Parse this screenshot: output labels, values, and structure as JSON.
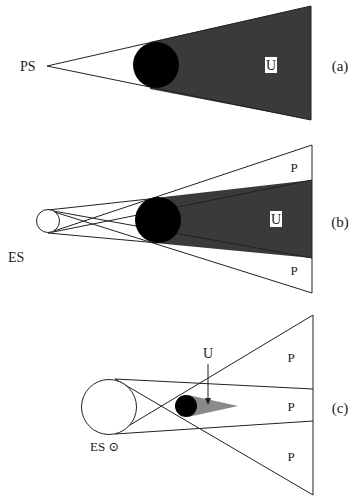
{
  "figure": {
    "panels": [
      {
        "id": "a",
        "panel_label": "(a)",
        "source_label": "PS",
        "umbra_label": "U",
        "source_type": "point source"
      },
      {
        "id": "b",
        "panel_label": "(b)",
        "source_label": "ES",
        "umbra_label": "U",
        "penumbra_labels": [
          "P",
          "P"
        ],
        "source_type": "extended source smaller than object"
      },
      {
        "id": "c",
        "panel_label": "(c)",
        "source_label": "ES ⊙",
        "umbra_label": "U",
        "penumbra_labels": [
          "P",
          "P",
          "P"
        ],
        "source_type": "extended source larger than object"
      }
    ],
    "colors": {
      "background": "#ffffff",
      "object": "#000000",
      "umbra_dark": "#3a3a3a",
      "umbra_light": "#8a8a8a",
      "lines": "#222222"
    }
  }
}
